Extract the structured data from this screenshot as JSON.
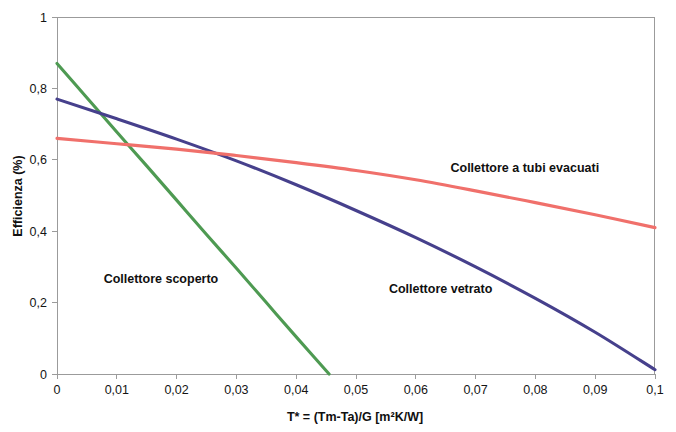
{
  "chart_data": {
    "type": "line",
    "title": "",
    "xlabel": "T* = (Tm-Ta)/G   [m²K/W]",
    "ylabel": "Efficienza (%)",
    "xlim": [
      0,
      0.1
    ],
    "ylim": [
      0,
      1
    ],
    "grid": false,
    "legend_position": "inline-annotations",
    "x_tick_labels": [
      "0",
      "0,01",
      "0,02",
      "0,03",
      "0,04",
      "0,05",
      "0,06",
      "0,07",
      "0,08",
      "0,09",
      "0,1"
    ],
    "x_tick_values": [
      0,
      0.01,
      0.02,
      0.03,
      0.04,
      0.05,
      0.06,
      0.07,
      0.08,
      0.09,
      0.1
    ],
    "y_tick_labels": [
      "0",
      "0,2",
      "0,4",
      "0,6",
      "0,8",
      "1"
    ],
    "y_tick_values": [
      0,
      0.2,
      0.4,
      0.6,
      0.8,
      1
    ],
    "series": [
      {
        "name": "Collettore scoperto",
        "color": "#4E9A52",
        "label_x": 0.0078,
        "label_y": 0.255,
        "x": [
          0,
          0.005,
          0.01,
          0.015,
          0.02,
          0.025,
          0.03,
          0.035,
          0.04,
          0.0455
        ],
        "values": [
          0.87,
          0.774,
          0.678,
          0.583,
          0.487,
          0.391,
          0.296,
          0.2,
          0.104,
          0.0
        ]
      },
      {
        "name": "Collettore vetrato",
        "color": "#46408C",
        "label_x": 0.0555,
        "label_y": 0.227,
        "x": [
          0,
          0.01,
          0.02,
          0.03,
          0.04,
          0.05,
          0.06,
          0.07,
          0.08,
          0.09,
          0.1
        ],
        "values": [
          0.77,
          0.715,
          0.658,
          0.597,
          0.53,
          0.458,
          0.382,
          0.3,
          0.212,
          0.117,
          0.012
        ]
      },
      {
        "name": "Collettore a tubi evacuati",
        "color": "#F0706B",
        "label_x": 0.0658,
        "label_y": 0.565,
        "x": [
          0,
          0.01,
          0.02,
          0.03,
          0.04,
          0.05,
          0.06,
          0.07,
          0.08,
          0.09,
          0.1
        ],
        "values": [
          0.66,
          0.645,
          0.63,
          0.612,
          0.592,
          0.57,
          0.544,
          0.513,
          0.48,
          0.446,
          0.41
        ]
      }
    ]
  }
}
